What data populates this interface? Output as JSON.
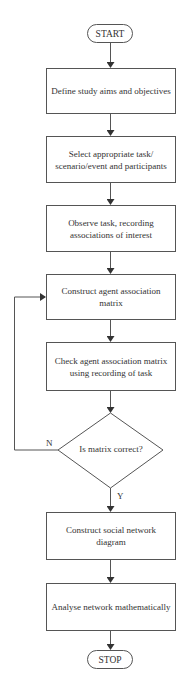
{
  "flowchart": {
    "start": "START",
    "steps": [
      "Define study aims and objectives",
      "Select appropriate task/ scenario/event and participants",
      "Observe task, recording associations of interest",
      "Construct agent association matrix",
      "Check agent association matrix using recording of task"
    ],
    "decision": "Is matrix correct?",
    "no_label": "N",
    "yes_label": "Y",
    "post_steps": [
      "Construct social network diagram",
      "Analyse network mathematically"
    ],
    "stop": "STOP"
  },
  "colors": {
    "line": "#555555",
    "text": "#333333",
    "background": "#ffffff"
  }
}
